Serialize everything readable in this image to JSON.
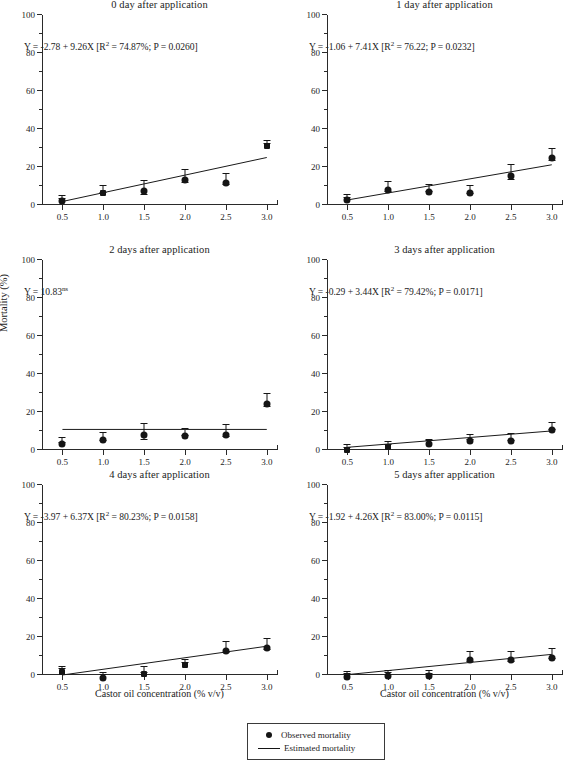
{
  "figure": {
    "xlabel": "Castor oil concentration (% v/v)",
    "ylabel": "Mortality (%)"
  },
  "legend": {
    "observed": "Observed mortality",
    "estimated": "Estimated mortality"
  },
  "axes": {
    "ylim": [
      0,
      100
    ],
    "yticks": [
      "0",
      "20",
      "40",
      "60",
      "80",
      "100"
    ],
    "xlim": [
      0.25,
      3.125
    ],
    "xticks": [
      "0.5",
      "1.0",
      "1.5",
      "2.0",
      "2.5",
      "3.0"
    ]
  },
  "chart_data": {
    "type": "scatter",
    "xlabel": "Castor oil concentration (% v/v)",
    "ylabel": "Mortality (%)",
    "xlim": [
      0.25,
      3.125
    ],
    "ylim": [
      0,
      100
    ],
    "xticks": [
      0.5,
      1.0,
      1.5,
      2.0,
      2.5,
      3.0
    ],
    "yticks": [
      0,
      20,
      40,
      60,
      80,
      100
    ],
    "grid": false,
    "legend_position": "bottom-center",
    "legend_entries": [
      "Observed mortality",
      "Estimated mortality"
    ],
    "panels": [
      {
        "title": "0 day after application",
        "equation": "Y = -2.78 + 9.26X [R² = 74.87%; P = 0.0260]",
        "eqn_html": "Y = -2.78 + 9.26X [R<sup>2</sup> = 74.87%; P = 0.0260]",
        "intercept": -2.78,
        "slope": 9.26,
        "r2_percent": 74.87,
        "p_value": 0.026,
        "x": [
          0.5,
          1.0,
          1.5,
          2.0,
          2.5,
          3.0
        ],
        "y": [
          4.0,
          8.0,
          9.0,
          15.0,
          13.5,
          33.0
        ],
        "yerr": [
          0.8,
          1.8,
          3.5,
          3.5,
          2.8,
          0.8
        ],
        "marker": [
          "circle",
          "square",
          "circle",
          "circle",
          "circle",
          "square"
        ]
      },
      {
        "title": "1 day after application",
        "equation": "Y = -1.06 + 7.41X [R² = 76.22; P = 0.0232]",
        "eqn_html": "Y = -1.06 + 7.41X [R<sup>2</sup> = 76.22; P = 0.0232]",
        "intercept": -1.06,
        "slope": 7.41,
        "r2_percent": 76.22,
        "p_value": 0.0232,
        "x": [
          0.5,
          1.0,
          1.5,
          2.0,
          2.5,
          3.0
        ],
        "y": [
          4.5,
          9.5,
          8.5,
          8.0,
          17.0,
          26.5
        ],
        "yerr": [
          0.6,
          2.5,
          1.8,
          2.2,
          4.0,
          3.2
        ],
        "marker": [
          "circle",
          "circle",
          "circle",
          "circle",
          "circle",
          "circle"
        ]
      },
      {
        "title": "2 days after application",
        "equation": "Y = 10.83ns",
        "eqn_html": "Y = 10.83<sup>ns</sup>",
        "intercept": 10.83,
        "slope": 0,
        "r2_percent": null,
        "p_value": null,
        "x": [
          0.5,
          1.0,
          1.5,
          2.0,
          2.5,
          3.0
        ],
        "y": [
          5.0,
          7.0,
          9.5,
          9.0,
          10.0,
          26.0
        ],
        "yerr": [
          1.2,
          2.2,
          4.0,
          1.8,
          3.2,
          3.5
        ],
        "marker": [
          "circle",
          "circle",
          "circle",
          "circle",
          "circle",
          "circle"
        ]
      },
      {
        "title": "3 days after application",
        "equation": "Y = -0.29 + 3.44X [R² = 79.42%; P = 0.0171]",
        "eqn_html": "Y = -0.29 + 3.44X [R<sup>2</sup> = 79.42%; P = 0.0171]",
        "intercept": -0.29,
        "slope": 3.44,
        "r2_percent": 79.42,
        "p_value": 0.0171,
        "x": [
          0.5,
          1.0,
          1.5,
          2.0,
          2.5,
          3.0
        ],
        "y": [
          2.0,
          3.5,
          5.0,
          6.5,
          6.5,
          12.5
        ],
        "yerr": [
          0.8,
          0.6,
          0.5,
          1.2,
          2.0,
          1.8
        ],
        "marker": [
          "square",
          "square",
          "circle",
          "circle",
          "circle",
          "circle"
        ]
      },
      {
        "title": "4 days after application",
        "equation": "Y = -3.97 + 6.37X [R² = 80.23%; P = 0.0158]",
        "eqn_html": "Y = -3.97 + 6.37X [R<sup>2</sup> = 80.23%; P = 0.0158]",
        "intercept": -3.97,
        "slope": 6.37,
        "r2_percent": 80.23,
        "p_value": 0.0158,
        "x": [
          0.5,
          1.0,
          1.5,
          2.0,
          2.5,
          3.0
        ],
        "y": [
          3.5,
          0.5,
          2.5,
          7.0,
          14.5,
          16.0
        ],
        "yerr": [
          0.5,
          0.5,
          1.5,
          0.8,
          3.0,
          3.0
        ],
        "marker": [
          "square",
          "circle",
          "square",
          "square",
          "circle",
          "circle"
        ]
      },
      {
        "title": "5 days after application",
        "equation": "Y = -1.92 + 4.26X [R² = 83.00%; P = 0.0115]",
        "eqn_html": "Y = -1.92 + 4.26X [R<sup>2</sup> = 83.00%; P = 0.0115]",
        "intercept": -1.92,
        "slope": 4.26,
        "r2_percent": 83.0,
        "p_value": 0.0115,
        "x": [
          0.5,
          1.0,
          1.5,
          2.0,
          2.5,
          3.0
        ],
        "y": [
          1.0,
          1.5,
          1.5,
          9.5,
          9.5,
          11.0
        ],
        "yerr": [
          0.5,
          0.6,
          0.8,
          2.5,
          2.5,
          2.8
        ],
        "marker": [
          "circle",
          "circle",
          "circle",
          "circle",
          "circle",
          "circle"
        ]
      }
    ]
  }
}
